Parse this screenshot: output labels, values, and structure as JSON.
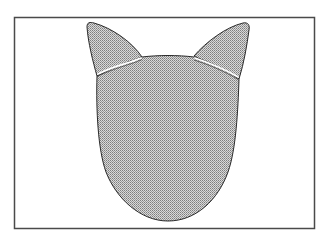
{
  "figure": {
    "colors": {
      "background": "#ffffff",
      "frame_stroke": "#4a4a4a",
      "outline_stroke": "#2a2a2a",
      "fill_base": "#d6d6d6",
      "stipple_dot": "#7a7a7a",
      "ear_band": "#ffffff"
    },
    "parts": {
      "frame": "rectangle-frame",
      "head": "head-shape",
      "left_ear": "left-ear",
      "right_ear": "right-ear",
      "left_ear_band": "left-ear-band",
      "right_ear_band": "right-ear-band"
    }
  }
}
